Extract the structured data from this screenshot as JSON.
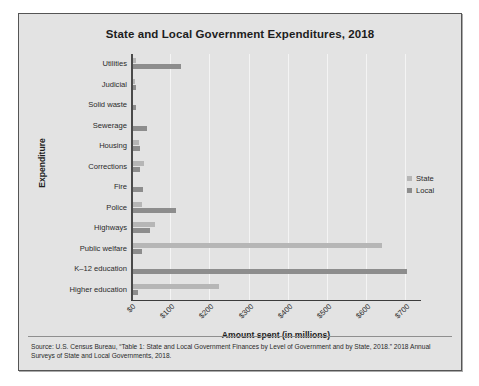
{
  "chart_data": {
    "type": "bar",
    "orientation": "horizontal",
    "title": "State and Local Government Expenditures, 2018",
    "xlabel": "Amount spent (in millions)",
    "ylabel": "Expenditure",
    "xlim": [
      0,
      740
    ],
    "xticks": [
      "$0",
      "$100",
      "$200",
      "$300",
      "$400",
      "$500",
      "$600",
      "$700"
    ],
    "xtick_values": [
      0,
      100,
      200,
      300,
      400,
      500,
      600,
      700
    ],
    "grid": "vertical",
    "legend_position": "right",
    "categories": [
      "Utilities",
      "Judicial",
      "Solid waste",
      "Sewerage",
      "Housing",
      "Corrections",
      "Fire",
      "Police",
      "Highways",
      "Public welfare",
      "K–12 education",
      "Higher education"
    ],
    "series": [
      {
        "name": "State",
        "color": "#b6b6b6",
        "values": [
          14,
          9,
          2,
          4,
          20,
          32,
          1,
          28,
          62,
          640,
          5,
          225
        ]
      },
      {
        "name": "Local",
        "color": "#8d8d8d",
        "values": [
          128,
          13,
          14,
          41,
          23,
          24,
          30,
          115,
          48,
          28,
          705,
          18
        ]
      }
    ],
    "source_note": "Source: U.S. Census Bureau, “Table 1: State and Local Government Finances by Level of Government and by State, 2018.” 2018 Annual Surveys of State and Local Governments, 2018."
  },
  "legend": {
    "entries": [
      {
        "label": "State",
        "color": "#b6b6b6"
      },
      {
        "label": "Local",
        "color": "#8d8d8d"
      }
    ]
  }
}
